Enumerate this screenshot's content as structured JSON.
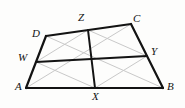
{
  "figure": {
    "kind": "geometry-diagram",
    "canvas": {
      "width": 185,
      "height": 108
    },
    "colors": {
      "background": "#fdfdfc",
      "outline": "#131313",
      "bimedian": "#131313",
      "faint": "#c9c9c9",
      "label": "#131313"
    },
    "stroke_widths": {
      "outline": 2.2,
      "bimedian": 2.0,
      "faint": 1.0
    },
    "points": {
      "A": {
        "label": "A",
        "x": 26,
        "y": 88,
        "label_x": 15,
        "label_y": 81
      },
      "B": {
        "label": "B",
        "x": 163,
        "y": 88,
        "label_x": 167,
        "label_y": 81
      },
      "C": {
        "label": "C",
        "x": 131,
        "y": 24,
        "label_x": 133,
        "label_y": 13
      },
      "D": {
        "label": "D",
        "x": 46,
        "y": 36,
        "label_x": 32,
        "label_y": 28
      },
      "W": {
        "label": "W",
        "x": 36,
        "y": 62,
        "label_x": 18,
        "label_y": 52
      },
      "X": {
        "label": "X",
        "x": 95,
        "y": 88,
        "label_x": 92,
        "label_y": 91
      },
      "Y": {
        "label": "Y",
        "x": 147,
        "y": 56,
        "label_x": 151,
        "label_y": 46
      },
      "Z": {
        "label": "Z",
        "x": 88,
        "y": 30,
        "label_x": 78,
        "label_y": 12
      }
    },
    "outline_edges": [
      {
        "name": "edge-AB",
        "from": "A",
        "to": "B"
      },
      {
        "name": "edge-BC",
        "from": "B",
        "to": "C"
      },
      {
        "name": "edge-CD",
        "from": "C",
        "to": "D"
      },
      {
        "name": "edge-DA",
        "from": "D",
        "to": "A"
      }
    ],
    "bimedians": [
      {
        "name": "bimedian-WY",
        "from": "W",
        "to": "Y"
      },
      {
        "name": "bimedian-XZ",
        "from": "X",
        "to": "Z"
      }
    ],
    "faint_lines": [
      {
        "name": "diagonal-AC",
        "from": "A",
        "to": "C"
      },
      {
        "name": "diagonal-BD",
        "from": "B",
        "to": "D"
      },
      {
        "name": "varignon-WZ",
        "from": "W",
        "to": "Z"
      },
      {
        "name": "varignon-ZY",
        "from": "Z",
        "to": "Y"
      },
      {
        "name": "varignon-YX",
        "from": "Y",
        "to": "X"
      },
      {
        "name": "varignon-XW",
        "from": "X",
        "to": "W"
      }
    ]
  }
}
